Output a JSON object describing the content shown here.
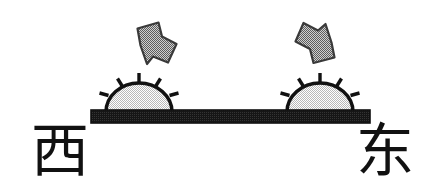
{
  "diagram": {
    "background_color": "#ffffff",
    "ink_color": "#111111",
    "sun_fill_color": "#dcdcdc",
    "arrow_fill_color": "#999999",
    "horizon_color": "#111111",
    "labels": {
      "west": "西",
      "east": "东"
    },
    "suns": [
      {
        "id": "sun-left",
        "position": "left",
        "shape": "half-circle",
        "ray_count": 5,
        "sits_on": "horizon"
      },
      {
        "id": "sun-right",
        "position": "right",
        "shape": "half-circle",
        "ray_count": 5,
        "sits_on": "horizon"
      }
    ],
    "arrows": [
      {
        "id": "arrow-left",
        "direction": "up-left",
        "meaning": "setting-direction-marker",
        "icon": "arrow-up-left-icon"
      },
      {
        "id": "arrow-right",
        "direction": "down-right",
        "meaning": "rising-direction-marker",
        "icon": "arrow-down-right-icon"
      }
    ],
    "horizon": {
      "id": "horizon-bar",
      "orientation": "horizontal"
    }
  }
}
